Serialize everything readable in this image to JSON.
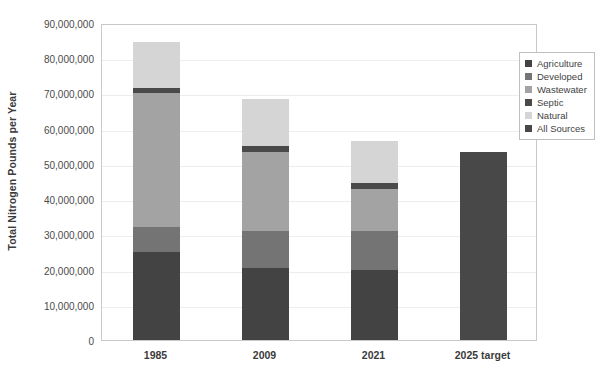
{
  "chart_data": {
    "type": "bar",
    "subtype": "stacked-bar",
    "title": "",
    "xlabel": "",
    "ylabel": "Total Nitrogen Pounds per Year",
    "categories": [
      "1985",
      "2009",
      "2021",
      "2025 target"
    ],
    "ylim": [
      0,
      90000000
    ],
    "y_tick_step": 10000000,
    "y_tick_labels": [
      "90,000,000",
      "80,000,000",
      "70,000,000",
      "60,000,000",
      "50,000,000",
      "40,000,000",
      "30,000,000",
      "20,000,000",
      "10,000,000",
      "0"
    ],
    "y_tick_values": [
      90000000,
      80000000,
      70000000,
      60000000,
      50000000,
      40000000,
      30000000,
      20000000,
      10000000,
      0
    ],
    "grid": true,
    "grid_axis": "y",
    "legend_position": "top-right-inside",
    "series": [
      {
        "name": "Agriculture",
        "color": "#434343",
        "values": [
          25000000,
          20500000,
          20000000,
          null
        ]
      },
      {
        "name": "Developed",
        "color": "#747474",
        "values": [
          7000000,
          10500000,
          11000000,
          null
        ]
      },
      {
        "name": "Wastewater",
        "color": "#a3a3a3",
        "values": [
          38000000,
          22500000,
          12000000,
          null
        ]
      },
      {
        "name": "Septic",
        "color": "#4a4a4a",
        "values": [
          1500000,
          1500000,
          1500000,
          null
        ]
      },
      {
        "name": "Natural",
        "color": "#d5d5d5",
        "values": [
          13000000,
          13500000,
          12000000,
          null
        ]
      },
      {
        "name": "All Sources",
        "color": "#484848",
        "values": [
          null,
          null,
          null,
          53500000
        ]
      }
    ],
    "totals": [
      84500000,
      68500000,
      56500000,
      53500000
    ]
  },
  "legend": {
    "items": [
      {
        "label": "Agriculture",
        "color": "#434343"
      },
      {
        "label": "Developed",
        "color": "#747474"
      },
      {
        "label": "Wastewater",
        "color": "#a3a3a3"
      },
      {
        "label": "Septic",
        "color": "#4a4a4a"
      },
      {
        "label": "Natural",
        "color": "#d5d5d5"
      },
      {
        "label": "All Sources",
        "color": "#484848"
      }
    ]
  },
  "style": {
    "plot_border_color": "#c9c9c9",
    "gridline_color": "#eceded",
    "axis_text_color": "#4a4a4a",
    "category_text_color": "#3b3b3b",
    "background": "#ffffff"
  }
}
